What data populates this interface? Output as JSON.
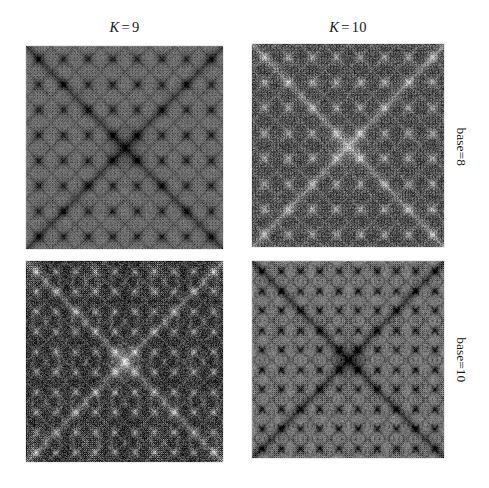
{
  "figure": {
    "background_color": "#ffffff",
    "columns": [
      {
        "id": "k9",
        "symbol": "K",
        "operator": "=",
        "value": "9"
      },
      {
        "id": "k10",
        "symbol": "K",
        "operator": "=",
        "value": "10"
      }
    ],
    "rows": [
      {
        "id": "base8",
        "label": "base=8"
      },
      {
        "id": "base10",
        "label": "base=10"
      }
    ],
    "panels": [
      {
        "id": "k9-base8",
        "column": "K = 9",
        "row": "base=8",
        "description": "medium-gray fractal lattice with dark X diagonals",
        "base_gray": "#7d7d7d",
        "mean_level": 125,
        "contrast": 0.42,
        "base": 8,
        "depth": 9,
        "cell_divisions": 8,
        "seed": 1109
      },
      {
        "id": "k10-base8",
        "column": "K = 10",
        "row": "base=8",
        "description": "dark speckled fractal with faint light X diagonals",
        "base_gray": "#3c3c3c",
        "mean_level": 62,
        "contrast": 0.78,
        "base": 8,
        "depth": 10,
        "cell_divisions": 16,
        "seed": 2110
      },
      {
        "id": "k9-base10",
        "column": "K = 9",
        "row": "base=10",
        "description": "very dark blobby starburst lattice",
        "base_gray": "#242424",
        "mean_level": 36,
        "contrast": 0.88,
        "base": 10,
        "depth": 9,
        "cell_divisions": 10,
        "seed": 3109
      },
      {
        "id": "k10-base10",
        "column": "K = 10",
        "row": "base=10",
        "description": "light-gray field with scattered dark speckle clusters",
        "base_gray": "#8c8c8c",
        "mean_level": 140,
        "contrast": 0.55,
        "base": 10,
        "depth": 10,
        "cell_divisions": 20,
        "seed": 4110
      }
    ]
  },
  "chart_data": {
    "type": "heatmap",
    "title": "",
    "xlabel": "",
    "ylabel": "",
    "grid": false,
    "legend": null,
    "layout": {
      "rows": 2,
      "cols": 2
    },
    "col_categories": [
      "K = 9",
      "K = 10"
    ],
    "row_categories": [
      "base=8",
      "base=10"
    ],
    "colormap": "grayscale",
    "panels": [
      {
        "row": "base=8",
        "col": "K = 9",
        "mean_level": 125,
        "min_level": 18,
        "max_level": 176
      },
      {
        "row": "base=8",
        "col": "K = 10",
        "mean_level": 62,
        "min_level": 4,
        "max_level": 198
      },
      {
        "row": "base=10",
        "col": "K = 9",
        "mean_level": 36,
        "min_level": 0,
        "max_level": 150
      },
      {
        "row": "base=10",
        "col": "K = 10",
        "mean_level": 140,
        "min_level": 28,
        "max_level": 204
      }
    ]
  }
}
